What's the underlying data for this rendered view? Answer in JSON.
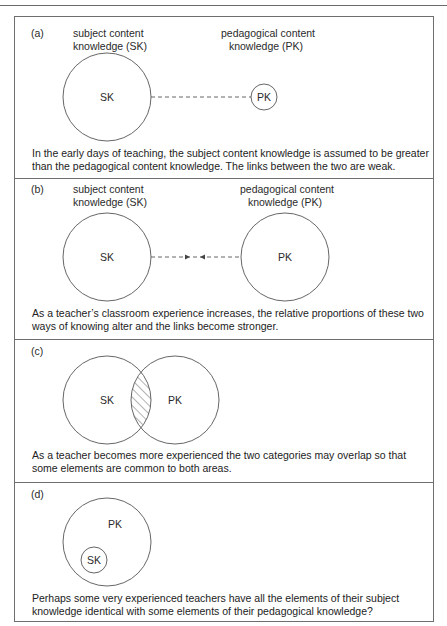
{
  "panels": [
    {
      "id": "a",
      "label": "(a)",
      "heading_left": [
        "subject content",
        "knowledge (SK)"
      ],
      "heading_right": [
        "pedagogical content",
        "knowledge (PK)"
      ],
      "circles": [
        {
          "name": "SK",
          "label": "SK",
          "size": "large"
        },
        {
          "name": "PK",
          "label": "PK",
          "size": "small"
        }
      ],
      "link": "weak dashed line",
      "caption": "In the early days of teaching, the subject content knowledge is assumed to be greater than the pedagogical content knowledge. The links between the two are weak."
    },
    {
      "id": "b",
      "label": "(b)",
      "heading_left": [
        "subject content",
        "knowledge (SK)"
      ],
      "heading_right": [
        "pedagogical content",
        "knowledge (PK)"
      ],
      "circles": [
        {
          "name": "SK",
          "label": "SK",
          "size": "large"
        },
        {
          "name": "PK",
          "label": "PK",
          "size": "large"
        }
      ],
      "link": "dashed line with converging arrows",
      "caption": "As a teacher’s classroom experience increases, the relative proportions of these two ways of knowing alter and the links become stronger."
    },
    {
      "id": "c",
      "label": "(c)",
      "circles": [
        {
          "name": "SK",
          "label": "SK",
          "size": "large"
        },
        {
          "name": "PK",
          "label": "PK",
          "size": "large"
        }
      ],
      "overlap": "hatched intersection",
      "caption": "As a teacher becomes more experienced the two categories may overlap so that some elements are common to both areas."
    },
    {
      "id": "d",
      "label": "(d)",
      "circles": [
        {
          "name": "PK",
          "label": "PK",
          "size": "large"
        },
        {
          "name": "SK",
          "label": "SK",
          "size": "small",
          "inside": "PK"
        }
      ],
      "caption": "Perhaps some very experienced teachers have all the elements of their subject knowledge identical with some elements of their pedagogical knowledge?"
    }
  ],
  "colors": {
    "line": "#555555",
    "border": "#6e6e6e",
    "text": "#2a2a2a"
  }
}
